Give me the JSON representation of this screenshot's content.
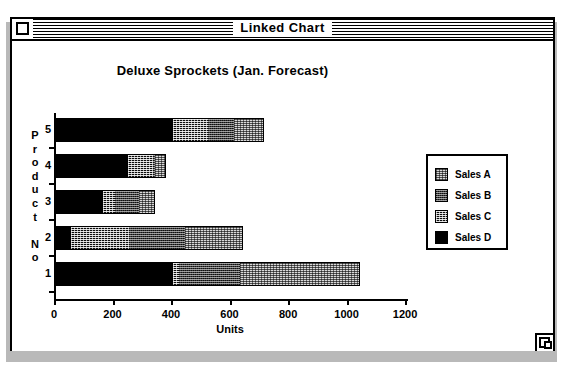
{
  "window": {
    "title": "Linked Chart",
    "close_box": "close-box",
    "grow_box": "grow-box"
  },
  "chart_data": {
    "type": "bar",
    "orientation": "horizontal",
    "stacked": true,
    "title": "Deluxe Sprockets (Jan. Forecast)",
    "xlabel": "Units",
    "ylabel": "Product No",
    "xlim": [
      0,
      1200
    ],
    "xticks": [
      0,
      200,
      400,
      600,
      800,
      1000,
      1200
    ],
    "xticklabels": [
      "0",
      "200",
      "400",
      "600",
      "800",
      "1000",
      "1200"
    ],
    "categories": [
      "5",
      "4",
      "3",
      "2",
      "1"
    ],
    "grid": false,
    "legend_position": "right",
    "series": [
      {
        "name": "Sales D",
        "pattern": "solid-black",
        "values": [
          400,
          245,
          160,
          50,
          400
        ]
      },
      {
        "name": "Sales C",
        "pattern": "dense-dither",
        "values": [
          120,
          85,
          40,
          200,
          20
        ]
      },
      {
        "name": "Sales B",
        "pattern": "medium-gray",
        "values": [
          90,
          10,
          85,
          190,
          210
        ]
      },
      {
        "name": "Sales A",
        "pattern": "light-dither",
        "values": [
          100,
          35,
          55,
          200,
          410
        ]
      }
    ],
    "totals": [
      710,
      375,
      340,
      640,
      1040
    ]
  },
  "legend": {
    "entries": [
      {
        "label": "Sales A",
        "pattern": "light-dither"
      },
      {
        "label": "Sales B",
        "pattern": "medium-gray"
      },
      {
        "label": "Sales C",
        "pattern": "dense-dither"
      },
      {
        "label": "Sales D",
        "pattern": "solid-black"
      }
    ]
  }
}
